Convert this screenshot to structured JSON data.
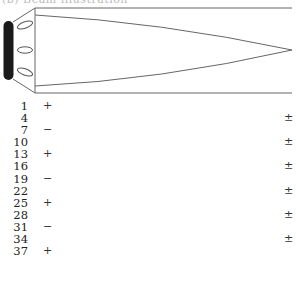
{
  "caption": "(b) Beam illustration",
  "diagram": {
    "stroke_color": "#666666",
    "cap_color": "#1a1a1a",
    "elements": [
      "end-cap",
      "connector-trapezoid",
      "oval-slot-top",
      "oval-slot-middle",
      "oval-slot-bottom",
      "outer-rectangle",
      "tapered-inner-beam"
    ]
  },
  "rows": [
    {
      "num": "1",
      "sign": "+",
      "pm": ""
    },
    {
      "num": "4",
      "sign": "",
      "pm": "±"
    },
    {
      "num": "7",
      "sign": "−",
      "pm": ""
    },
    {
      "num": "10",
      "sign": "",
      "pm": "±"
    },
    {
      "num": "13",
      "sign": "+",
      "pm": ""
    },
    {
      "num": "16",
      "sign": "",
      "pm": "±"
    },
    {
      "num": "19",
      "sign": "−",
      "pm": ""
    },
    {
      "num": "22",
      "sign": "",
      "pm": "±"
    },
    {
      "num": "25",
      "sign": "+",
      "pm": ""
    },
    {
      "num": "28",
      "sign": "",
      "pm": "±"
    },
    {
      "num": "31",
      "sign": "−",
      "pm": ""
    },
    {
      "num": "34",
      "sign": "",
      "pm": "±"
    },
    {
      "num": "37",
      "sign": "+",
      "pm": ""
    }
  ]
}
